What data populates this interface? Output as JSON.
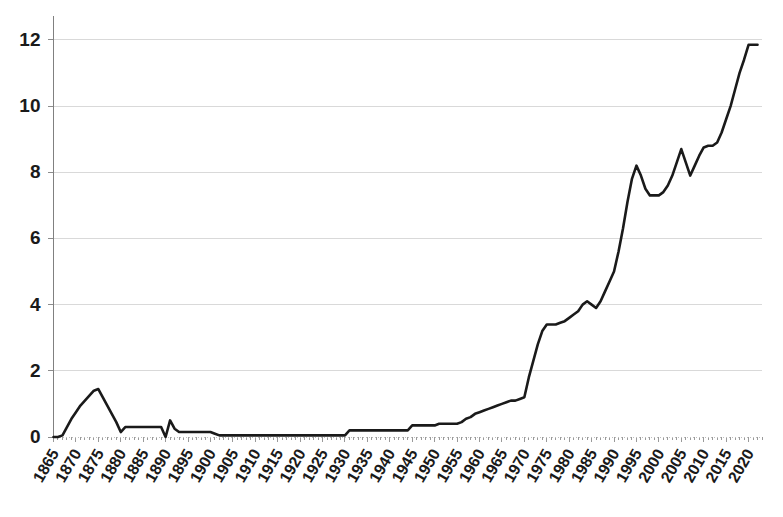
{
  "chart_data": {
    "type": "line",
    "title": "",
    "subtitle": "",
    "xlabel": "",
    "ylabel": "",
    "grid": true,
    "legend": false,
    "legend_position": "none",
    "line_color": "#1a1a1a",
    "grid_color": "#d9d9d9",
    "background_color": "#ffffff",
    "xlim": [
      1865,
      2023
    ],
    "ylim": [
      0,
      12.6
    ],
    "y_ticks": [
      0,
      2,
      4,
      6,
      8,
      10,
      12
    ],
    "y_tick_labels": [
      "0",
      "2",
      "4",
      "6",
      "8",
      "10",
      "12"
    ],
    "x_tick_labels": [
      "1865",
      "1870",
      "1875",
      "1880",
      "1885",
      "1890",
      "1895",
      "1900",
      "1905",
      "1910",
      "1915",
      "1920",
      "1925",
      "1930",
      "1935",
      "1940",
      "1945",
      "1950",
      "1955",
      "1960",
      "1965",
      "1970",
      "1975",
      "1980",
      "1985",
      "1990",
      "1995",
      "2000",
      "2005",
      "2010",
      "2015",
      "2020"
    ],
    "x_tick_values": [
      1865,
      1870,
      1875,
      1880,
      1885,
      1890,
      1895,
      1900,
      1905,
      1910,
      1915,
      1920,
      1925,
      1930,
      1935,
      1940,
      1945,
      1950,
      1955,
      1960,
      1965,
      1970,
      1975,
      1980,
      1985,
      1990,
      1995,
      2000,
      2005,
      2010,
      2015,
      2020
    ],
    "x_tick_rotation_deg": 60,
    "series": [
      {
        "name": "series-1",
        "x": [
          1865,
          1866,
          1867,
          1868,
          1869,
          1870,
          1871,
          1872,
          1873,
          1874,
          1875,
          1876,
          1877,
          1878,
          1879,
          1880,
          1881,
          1882,
          1883,
          1884,
          1885,
          1886,
          1887,
          1888,
          1889,
          1890,
          1891,
          1892,
          1893,
          1894,
          1895,
          1896,
          1897,
          1898,
          1899,
          1900,
          1901,
          1902,
          1903,
          1904,
          1905,
          1906,
          1907,
          1908,
          1909,
          1910,
          1911,
          1912,
          1913,
          1914,
          1915,
          1916,
          1917,
          1918,
          1919,
          1920,
          1921,
          1922,
          1923,
          1924,
          1925,
          1926,
          1927,
          1928,
          1929,
          1930,
          1931,
          1932,
          1933,
          1934,
          1935,
          1936,
          1937,
          1938,
          1939,
          1940,
          1941,
          1942,
          1943,
          1944,
          1945,
          1946,
          1947,
          1948,
          1949,
          1950,
          1951,
          1952,
          1953,
          1954,
          1955,
          1956,
          1957,
          1958,
          1959,
          1960,
          1961,
          1962,
          1963,
          1964,
          1965,
          1966,
          1967,
          1968,
          1969,
          1970,
          1971,
          1972,
          1973,
          1974,
          1975,
          1976,
          1977,
          1978,
          1979,
          1980,
          1981,
          1982,
          1983,
          1984,
          1985,
          1986,
          1987,
          1988,
          1989,
          1990,
          1991,
          1992,
          1993,
          1994,
          1995,
          1996,
          1997,
          1998,
          1999,
          2000,
          2001,
          2002,
          2003,
          2004,
          2005,
          2006,
          2007,
          2008,
          2009,
          2010,
          2011,
          2012,
          2013,
          2014,
          2015,
          2016,
          2017,
          2018,
          2019,
          2020,
          2021,
          2022
        ],
        "values": [
          0.0,
          0.0,
          0.05,
          0.3,
          0.55,
          0.75,
          0.95,
          1.1,
          1.25,
          1.4,
          1.45,
          1.2,
          0.95,
          0.7,
          0.45,
          0.15,
          0.3,
          0.3,
          0.3,
          0.3,
          0.3,
          0.3,
          0.3,
          0.3,
          0.3,
          0.0,
          0.5,
          0.25,
          0.15,
          0.15,
          0.15,
          0.15,
          0.15,
          0.15,
          0.15,
          0.15,
          0.1,
          0.05,
          0.05,
          0.05,
          0.05,
          0.05,
          0.05,
          0.05,
          0.05,
          0.05,
          0.05,
          0.05,
          0.05,
          0.05,
          0.05,
          0.05,
          0.05,
          0.05,
          0.05,
          0.05,
          0.05,
          0.05,
          0.05,
          0.05,
          0.05,
          0.05,
          0.05,
          0.05,
          0.05,
          0.05,
          0.2,
          0.2,
          0.2,
          0.2,
          0.2,
          0.2,
          0.2,
          0.2,
          0.2,
          0.2,
          0.2,
          0.2,
          0.2,
          0.2,
          0.35,
          0.35,
          0.35,
          0.35,
          0.35,
          0.35,
          0.4,
          0.4,
          0.4,
          0.4,
          0.4,
          0.45,
          0.55,
          0.6,
          0.7,
          0.75,
          0.8,
          0.85,
          0.9,
          0.95,
          1.0,
          1.05,
          1.1,
          1.1,
          1.15,
          1.2,
          1.8,
          2.3,
          2.8,
          3.2,
          3.4,
          3.4,
          3.4,
          3.45,
          3.5,
          3.6,
          3.7,
          3.8,
          4.0,
          4.1,
          4.0,
          3.9,
          4.1,
          4.4,
          4.7,
          5.0,
          5.6,
          6.3,
          7.1,
          7.8,
          8.2,
          7.9,
          7.5,
          7.3,
          7.3,
          7.3,
          7.4,
          7.6,
          7.9,
          8.3,
          8.7,
          8.3,
          7.9,
          8.2,
          8.5,
          8.75,
          8.8,
          8.8,
          8.9,
          9.2,
          9.6,
          10.0,
          10.5,
          11.0,
          11.4,
          11.85,
          11.85,
          11.85
        ]
      }
    ]
  }
}
